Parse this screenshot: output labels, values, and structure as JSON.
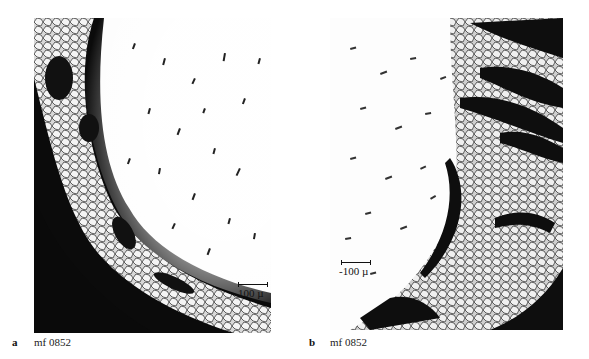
{
  "figure": {
    "panels": [
      {
        "letter": "a",
        "caption": "mf 0852",
        "scale_bar": "100 µ",
        "description": "micrograph: grain structure at dark lower-left edge, scattered dark inclusions on bright field"
      },
      {
        "letter": "b",
        "caption": "mf 0852",
        "scale_bar": "-100 µ",
        "description": "micrograph: dark streaked banded region on right, scattered inclusions on bright field at left"
      }
    ],
    "colors": {
      "dark": "#0a0a0a",
      "bright": "#ffffff",
      "mid": "#8a8a8a"
    }
  }
}
